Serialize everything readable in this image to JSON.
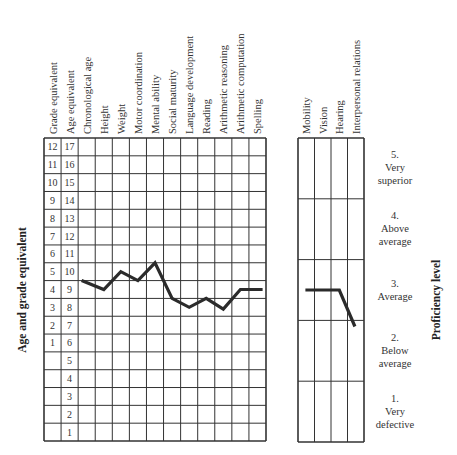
{
  "chart_data": [
    {
      "type": "line",
      "title": "",
      "ylabel": "Age and grade equivalent",
      "xlabel": "",
      "grid": true,
      "row_labels": {
        "grade_equivalent": [
          "12",
          "11",
          "10",
          "9",
          "8",
          "7",
          "6",
          "5",
          "4",
          "3",
          "2",
          "1",
          "",
          "",
          "",
          "",
          ""
        ],
        "age_equivalent": [
          "17",
          "16",
          "15",
          "14",
          "13",
          "12",
          "11",
          "10",
          "9",
          "8",
          "7",
          "6",
          "5",
          "4",
          "3",
          "2",
          "1"
        ]
      },
      "column_headers": [
        "Grade equivalent",
        "Age equivalent"
      ],
      "categories": [
        "Chronological age",
        "Height",
        "Weight",
        "Motor coordination",
        "Mental ability",
        "Social maturity",
        "Language development",
        "Reading",
        "Arithmetic reasoning",
        "Arithmetic computation",
        "Spelling"
      ],
      "series": [
        {
          "name": "Age equivalent profile",
          "values": [
            9.5,
            9.0,
            10.0,
            9.5,
            10.5,
            8.5,
            8.0,
            8.5,
            7.9,
            9.0,
            9.0
          ]
        }
      ],
      "ylim": [
        0.5,
        17.5
      ]
    },
    {
      "type": "line",
      "ylabel": "Proficiency level",
      "categories": [
        "Mobility",
        "Vision",
        "Hearing",
        "Interpersonal relations"
      ],
      "levels": [
        {
          "number": "5.",
          "line1": "Very",
          "line2": "superior"
        },
        {
          "number": "4.",
          "line1": "Above",
          "line2": "average"
        },
        {
          "number": "3.",
          "line1": "Average",
          "line2": ""
        },
        {
          "number": "2.",
          "line1": "Below",
          "line2": "average"
        },
        {
          "number": "1.",
          "line1": "Very",
          "line2": "defective"
        }
      ],
      "series": [
        {
          "name": "Proficiency profile",
          "values": [
            3.0,
            3.0,
            3.0,
            2.4
          ]
        }
      ],
      "ylim": [
        0.5,
        5.5
      ]
    }
  ],
  "labels": {
    "left_axis": "Age and grade equivalent",
    "right_axis": "Proficiency level"
  }
}
